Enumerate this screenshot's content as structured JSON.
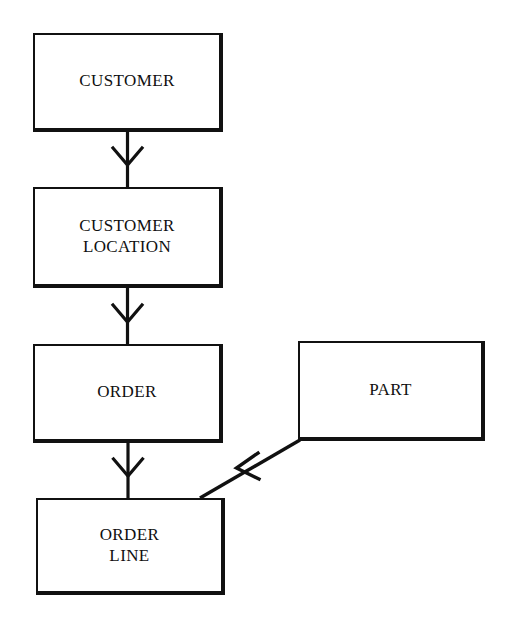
{
  "diagram": {
    "type": "entity-relationship-hierarchy",
    "title": "",
    "background_color": "#ffffff",
    "line_color": "#111111",
    "text_color": "#101010",
    "canvas": {
      "width": 517,
      "height": 640
    },
    "entities": [
      {
        "id": "customer",
        "label": "CUSTOMER",
        "x": 33,
        "y": 33,
        "width": 190,
        "height": 99
      },
      {
        "id": "customer-location",
        "label": "CUSTOMER\nLOCATION",
        "x": 33,
        "y": 187,
        "width": 190,
        "height": 101
      },
      {
        "id": "order",
        "label": "ORDER",
        "x": 33,
        "y": 344,
        "width": 190,
        "height": 99
      },
      {
        "id": "part",
        "label": "PART",
        "x": 298,
        "y": 341,
        "width": 187,
        "height": 100
      },
      {
        "id": "order-line",
        "label": "ORDER\nLINE",
        "x": 36,
        "y": 498,
        "width": 189,
        "height": 97
      }
    ],
    "connectors": [
      {
        "id": "customer-to-customer-location",
        "from": "customer",
        "to": "customer-location",
        "style": "crows-foot-down",
        "label": ""
      },
      {
        "id": "customer-location-to-order",
        "from": "customer-location",
        "to": "order",
        "style": "crows-foot-down",
        "label": ""
      },
      {
        "id": "order-to-order-line",
        "from": "order",
        "to": "order-line",
        "style": "crows-foot-down",
        "label": ""
      },
      {
        "id": "part-to-order-line",
        "from": "part",
        "to": "order-line",
        "style": "crows-foot-diagonal",
        "label": ""
      }
    ]
  }
}
